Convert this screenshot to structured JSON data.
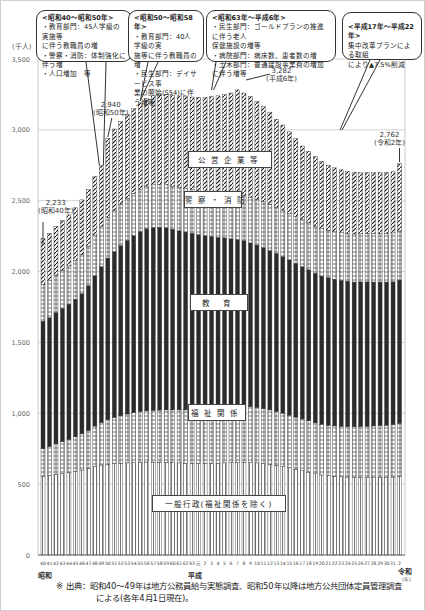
{
  "chart_data": {
    "type": "bar",
    "stacked": true,
    "ylabel": "(千人)",
    "ylim": [
      0,
      3500
    ],
    "yticks": [
      0,
      500,
      1000,
      1500,
      2000,
      2500,
      3000,
      3500
    ],
    "ytick_labels": [
      "0",
      "500",
      "1,000",
      "1,500",
      "2,000",
      "2,500",
      "3,000",
      "3,500"
    ],
    "grid": true,
    "x_tick_labels": [
      "40",
      "41",
      "42",
      "43",
      "44",
      "45",
      "46",
      "47",
      "48",
      "49",
      "50",
      "51",
      "52",
      "53",
      "54",
      "55",
      "56",
      "57",
      "58",
      "59",
      "60",
      "61",
      "62",
      "63",
      "元",
      "2",
      "3",
      "4",
      "5",
      "6",
      "7",
      "8",
      "9",
      "10",
      "11",
      "12",
      "13",
      "14",
      "15",
      "16",
      "17",
      "18",
      "19",
      "20",
      "21",
      "22",
      "23",
      "24",
      "25",
      "26",
      "27",
      "28",
      "29",
      "30",
      "31",
      "2"
    ],
    "era_labels": [
      {
        "label": "昭和",
        "at_index": 0
      },
      {
        "label": "平成",
        "at_index": 24
      },
      {
        "label": "令和",
        "at_index": 55
      }
    ],
    "x_unit": "(年)",
    "series": [
      {
        "name": "一般行政(福祉関係を除く)",
        "pattern": "vertical-lines",
        "values": [
          555,
          560,
          570,
          575,
          580,
          590,
          600,
          610,
          625,
          635,
          640,
          645,
          648,
          650,
          652,
          655,
          656,
          656,
          655,
          654,
          652,
          650,
          648,
          647,
          646,
          646,
          647,
          648,
          650,
          652,
          653,
          654,
          652,
          650,
          645,
          640,
          633,
          625,
          615,
          605,
          595,
          585,
          573,
          565,
          560,
          555,
          552,
          550,
          548,
          547,
          547,
          547,
          548,
          548,
          550,
          555
        ]
      },
      {
        "name": "福祉関係",
        "pattern": "dashed-boxes",
        "values": [
          195,
          205,
          215,
          225,
          235,
          245,
          255,
          270,
          285,
          300,
          315,
          325,
          335,
          345,
          352,
          358,
          362,
          365,
          368,
          370,
          372,
          374,
          376,
          378,
          380,
          382,
          385,
          388,
          392,
          395,
          398,
          398,
          395,
          392,
          388,
          384,
          380,
          376,
          372,
          368,
          365,
          362,
          360,
          358,
          356,
          356,
          356,
          357,
          358,
          360,
          362,
          364,
          366,
          368,
          370,
          375
        ]
      },
      {
        "name": "教育",
        "pattern": "solid-dark",
        "values": [
          900,
          910,
          925,
          940,
          955,
          970,
          990,
          1020,
          1060,
          1100,
          1140,
          1170,
          1200,
          1225,
          1250,
          1270,
          1285,
          1290,
          1290,
          1285,
          1275,
          1265,
          1255,
          1245,
          1235,
          1225,
          1215,
          1205,
          1195,
          1185,
          1175,
          1165,
          1155,
          1145,
          1135,
          1125,
          1115,
          1105,
          1095,
          1085,
          1075,
          1065,
          1055,
          1045,
          1040,
          1035,
          1030,
          1025,
          1020,
          1020,
          1018,
          1015,
          1012,
          1010,
          1008,
          1010
        ]
      },
      {
        "name": "警察・消防",
        "pattern": "dashed-boxes",
        "values": [
          260,
          262,
          265,
          268,
          270,
          273,
          276,
          280,
          283,
          286,
          289,
          291,
          293,
          295,
          297,
          299,
          300,
          301,
          302,
          303,
          304,
          305,
          306,
          307,
          308,
          310,
          312,
          314,
          316,
          318,
          320,
          322,
          323,
          324,
          325,
          326,
          327,
          328,
          329,
          330,
          331,
          332,
          333,
          334,
          335,
          336,
          337,
          338,
          339,
          340,
          341,
          342,
          343,
          344,
          345,
          346
        ]
      },
      {
        "name": "公営企業等",
        "pattern": "hatched",
        "values": [
          323,
          333,
          345,
          352,
          360,
          372,
          385,
          400,
          417,
          429,
          556,
          575,
          584,
          595,
          599,
          608,
          617,
          628,
          635,
          638,
          640,
          645,
          650,
          655,
          661,
          665,
          675,
          685,
          695,
          710,
          736,
          721,
          710,
          690,
          670,
          650,
          620,
          600,
          575,
          550,
          520,
          505,
          490,
          475,
          460,
          450,
          443,
          438,
          437,
          431,
          430,
          430,
          430,
          430,
          431,
          476
        ]
      }
    ],
    "totals": [
      2233,
      2270,
      2320,
      2360,
      2400,
      2450,
      2506,
      2580,
      2670,
      2750,
      2940,
      3006,
      3060,
      3110,
      3150,
      3190,
      3220,
      3240,
      3250,
      3250,
      3243,
      3239,
      3235,
      3232,
      3230,
      3228,
      3234,
      3240,
      3248,
      3260,
      3282,
      3260,
      3235,
      3201,
      3163,
      3125,
      3075,
      3034,
      2986,
      2938,
      2886,
      2849,
      2811,
      2777,
      2751,
      2732,
      2718,
      2708,
      2702,
      2698,
      2698,
      2698,
      2699,
      2700,
      2704,
      2762
    ],
    "annotations": [
      {
        "label": "2,233",
        "sub": "(昭和40年)",
        "index": 0,
        "value": 2233
      },
      {
        "label": "2,940",
        "sub": "(昭和50年)",
        "index": 10,
        "value": 2940
      },
      {
        "label": "3,282",
        "sub": "(平成6年)",
        "index": 30,
        "value": 3282
      },
      {
        "label": "2,762",
        "sub": "(令和2年)",
        "index": 55,
        "value": 2762
      }
    ],
    "callouts": [
      {
        "title": "<昭和40～昭和50年>",
        "lines": [
          "・教育部門：45人学級の実施等に伴う教職員の増",
          "・警察・消防：体制強化に伴う増",
          "・人口増加 等"
        ]
      },
      {
        "title": "<昭和50～昭和58年>",
        "lines": [
          "・教育部門：40人学級の実施等に伴う教職員の増",
          "・民生部門：デイサービス事業の開始(S54)に伴う増等"
        ]
      },
      {
        "title": "<昭和63年～平成6年>",
        "lines": [
          "・民生部門：ゴールドプランの推進に伴う老人保健施設の増等",
          "・病院部門：病床数、患者数の増",
          "・土木部門：普通建設事業費の増加に伴う増等"
        ]
      },
      {
        "title": "<平成17年～平成22年>",
        "lines": [
          "集中改革プランによる取組により▲7.5%削減"
        ]
      }
    ],
    "segment_labels": [
      "公営企業等",
      "警察・消防",
      "教育",
      "福祉関係",
      "一般行政(福祉関係を除く)"
    ]
  },
  "unit_label": "(千人)",
  "era": {
    "showa": "昭和",
    "heisei": "平成",
    "reiwa": "令和",
    "year_unit": "(年)"
  },
  "segment_labels": {
    "koei": "公営企業等",
    "keisatsu": "警察・消防",
    "kyoiku": "教 育",
    "fukushi": "福祉関係",
    "ippan": "一般行政(福祉関係を除く)"
  },
  "callouts": {
    "c1": {
      "title": "<昭和40～昭和50年>",
      "l1": "・教育部門：45人学級の実施等",
      "l2": "に伴う教職員の増",
      "l3": "・警察・消防：体制強化に伴う増",
      "l4": "・人口増加　等"
    },
    "c2": {
      "title": "<昭和50～昭和58年>",
      "l1": "・教育部門：40人学級の実",
      "l2": "施等に伴う教職員の増",
      "l3": "・民生部門：デイサービス事",
      "l4": "業の開始(S54)に伴う増等"
    },
    "c3": {
      "title": "<昭和63年～平成6年>",
      "l1": "・民生部門：ゴールドプランの推進に伴う老人",
      "l2": "保健施設の増等",
      "l3": "・病院部門：病床数、患者数の増",
      "l4": "・土木部門：普通建設事業費の増加に伴う増等"
    },
    "c4": {
      "title": "<平成17年～平成22年>",
      "l1": "集中改革プランによる取組",
      "l2": "により▲7.5%削減"
    }
  },
  "annotations": {
    "a1": {
      "v": "2,233",
      "s": "(昭和40年)"
    },
    "a2": {
      "v": "2,940",
      "s": "(昭和50年)"
    },
    "a3": {
      "v": "3,282",
      "s": "(平成6年)"
    },
    "a4": {
      "v": "2,762",
      "s": "(令和2年)"
    }
  },
  "footnote": {
    "line1": "※ 出典：昭和40～49年は地方公務員給与実態調査、昭和50年以降は地方公共団体定員管理調査",
    "line2": "による(各年4月1日現在)。"
  }
}
